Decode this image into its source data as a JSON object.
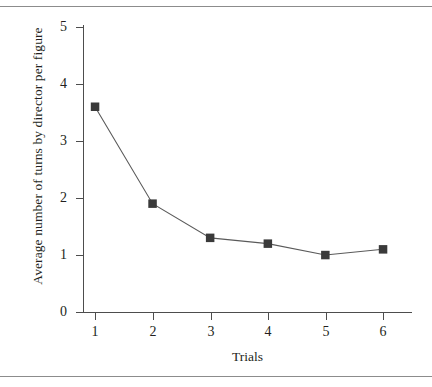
{
  "figure": {
    "x_axis_title": "Trials",
    "y_axis_title": "Average number of turns by director per figure",
    "marker_color": "#3a3a3a",
    "line_color": "#5a5a5a",
    "axis_color": "#4d4d4d",
    "rule_color": "#8c8c8c"
  },
  "chart_data": {
    "type": "line",
    "title": "",
    "xlabel": "Trials",
    "ylabel": "Average number of turns by director per figure",
    "x": [
      1,
      2,
      3,
      4,
      5,
      6
    ],
    "values": [
      3.6,
      1.9,
      1.3,
      1.2,
      1.0,
      1.1
    ],
    "series": [
      {
        "name": "Average number of turns by director per figure",
        "values": [
          3.6,
          1.9,
          1.3,
          1.2,
          1.0,
          1.1
        ]
      }
    ],
    "xlim": [
      0.5,
      6.6
    ],
    "ylim": [
      0,
      5
    ],
    "xticks": [
      1,
      2,
      3,
      4,
      5,
      6
    ],
    "xtick_labels": [
      "1",
      "2",
      "3",
      "4",
      "5",
      "6"
    ],
    "yticks": [
      0,
      1,
      2,
      3,
      4,
      5
    ],
    "ytick_labels": [
      "0",
      "1",
      "2",
      "3",
      "4",
      "5"
    ],
    "grid": false,
    "legend": false,
    "marker": "square",
    "marker_color": "#3a3a3a",
    "line_color": "#5a5a5a"
  }
}
